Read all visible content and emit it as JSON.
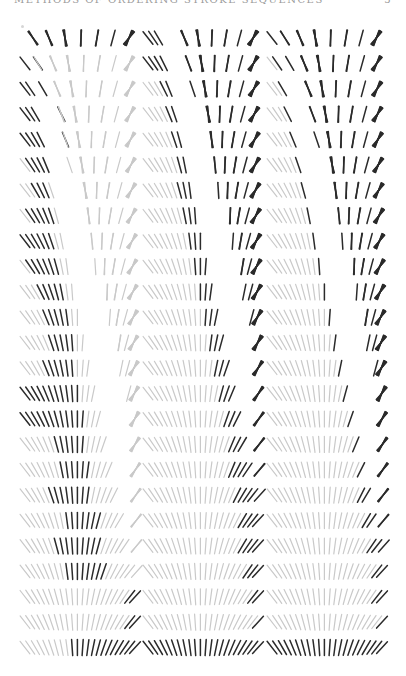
{
  "page": {
    "running_head": "METHODS OF ORDERING STROKE SEQUENCES",
    "page_number": "5"
  },
  "figure": {
    "panels": 3,
    "rows_per_panel": 25,
    "slots_per_row": 22,
    "colors": {
      "dark": "#2b2b2b",
      "light": "#c9c9c9"
    },
    "panel_x": [
      23,
      146,
      270
    ],
    "panel_width": 114,
    "row_y_start": 38,
    "row_pitch": 25.4,
    "stroke_length": 16,
    "angle_range_deg": [
      -38,
      42
    ],
    "cluster_layout_top_row": [
      [
        1,
        1,
        1
      ],
      [
        1,
        1,
        1
      ],
      [
        1,
        1,
        1,
        1
      ],
      [
        1,
        1
      ],
      [
        1,
        1
      ],
      [
        1
      ],
      [
        1,
        1
      ]
    ],
    "dark_ranges": {
      "panel_1": [
        [
          0,
          21
        ],
        [
          0,
          1
        ],
        [
          0,
          2
        ],
        [
          0,
          3
        ],
        [
          0,
          4
        ],
        [
          1,
          4
        ],
        [
          2,
          4
        ],
        [
          1,
          5
        ],
        [
          0,
          5
        ],
        [
          1,
          6
        ],
        [
          3,
          7
        ],
        [
          4,
          8
        ],
        [
          5,
          9
        ],
        [
          4,
          9
        ],
        [
          0,
          10
        ],
        [
          0,
          11
        ],
        [
          6,
          11
        ],
        [
          7,
          12
        ],
        [
          5,
          12
        ],
        [
          8,
          14
        ],
        [
          6,
          14
        ],
        [
          8,
          15
        ],
        [
          20,
          21
        ],
        [
          20,
          21
        ],
        [
          9,
          21
        ]
      ],
      "panel_2": [
        [
          0,
          21
        ],
        [
          0,
          21
        ],
        [
          3,
          21
        ],
        [
          4,
          21
        ],
        [
          5,
          21
        ],
        [
          6,
          21
        ],
        [
          6,
          21
        ],
        [
          7,
          21
        ],
        [
          8,
          21
        ],
        [
          9,
          21
        ],
        [
          10,
          21
        ],
        [
          11,
          21
        ],
        [
          12,
          21
        ],
        [
          13,
          21
        ],
        [
          14,
          21
        ],
        [
          15,
          21
        ],
        [
          16,
          21
        ],
        [
          16,
          21
        ],
        [
          17,
          21
        ],
        [
          18,
          21
        ],
        [
          18,
          21
        ],
        [
          19,
          21
        ],
        [
          20,
          21
        ],
        [
          21,
          21
        ],
        [
          0,
          21
        ]
      ],
      "panel_3": [
        [
          0,
          21
        ],
        [
          1,
          21
        ],
        [
          2,
          21
        ],
        [
          3,
          21
        ],
        [
          4,
          21
        ],
        [
          5,
          21
        ],
        [
          6,
          21
        ],
        [
          7,
          21
        ],
        [
          8,
          21
        ],
        [
          9,
          21
        ],
        [
          10,
          21
        ],
        [
          11,
          21
        ],
        [
          12,
          21
        ],
        [
          13,
          21
        ],
        [
          14,
          21
        ],
        [
          15,
          21
        ],
        [
          16,
          21
        ],
        [
          17,
          21
        ],
        [
          17,
          21
        ],
        [
          18,
          21
        ],
        [
          19,
          21
        ],
        [
          20,
          21
        ],
        [
          20,
          21
        ],
        [
          21,
          21
        ],
        [
          0,
          21
        ]
      ]
    },
    "converge_rows": {
      "panel_1": 0,
      "panel_2": 18,
      "panel_3": 19
    }
  }
}
